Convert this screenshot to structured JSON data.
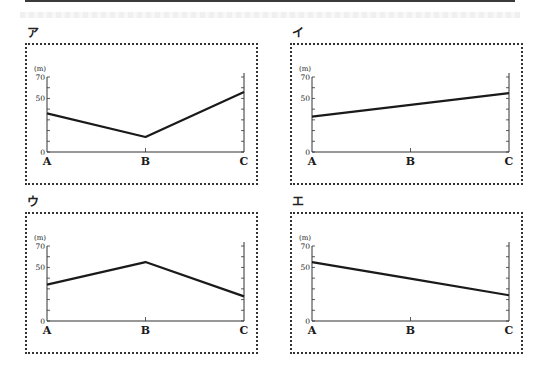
{
  "chart_data": [
    {
      "id": "a",
      "panel_label": "ア",
      "type": "line",
      "title": "",
      "unit_label": "(m)",
      "xlabel": "",
      "ylabel": "(m)",
      "categories": [
        "A",
        "B",
        "C"
      ],
      "values": [
        36,
        14,
        56
      ],
      "ylim": [
        0,
        70
      ],
      "y_ticks": [
        0,
        10,
        20,
        30,
        40,
        50,
        60,
        70
      ],
      "y_tick_labels": [
        "0",
        "50",
        "70"
      ],
      "grid": false,
      "legend": null
    },
    {
      "id": "i",
      "panel_label": "イ",
      "type": "line",
      "title": "",
      "unit_label": "(m)",
      "xlabel": "",
      "ylabel": "(m)",
      "categories": [
        "A",
        "B",
        "C"
      ],
      "values": [
        33,
        44,
        55
      ],
      "ylim": [
        0,
        70
      ],
      "y_ticks": [
        0,
        10,
        20,
        30,
        40,
        50,
        60,
        70
      ],
      "y_tick_labels": [
        "0",
        "50",
        "70"
      ],
      "grid": false,
      "legend": null
    },
    {
      "id": "u",
      "panel_label": "ウ",
      "type": "line",
      "title": "",
      "unit_label": "(m)",
      "xlabel": "",
      "ylabel": "(m)",
      "categories": [
        "A",
        "B",
        "C"
      ],
      "values": [
        34,
        55,
        23
      ],
      "ylim": [
        0,
        70
      ],
      "y_ticks": [
        0,
        10,
        20,
        30,
        40,
        50,
        60,
        70
      ],
      "y_tick_labels": [
        "0",
        "50",
        "70"
      ],
      "grid": false,
      "legend": null
    },
    {
      "id": "e",
      "panel_label": "エ",
      "type": "line",
      "title": "",
      "unit_label": "(m)",
      "xlabel": "",
      "ylabel": "(m)",
      "categories": [
        "A",
        "B",
        "C"
      ],
      "values": [
        55,
        39.5,
        24
      ],
      "ylim": [
        0,
        70
      ],
      "y_ticks": [
        0,
        10,
        20,
        30,
        40,
        50,
        60,
        70
      ],
      "y_tick_labels": [
        "0",
        "50",
        "70"
      ],
      "grid": false,
      "legend": null
    }
  ],
  "colors": {
    "line": "#1a1a1a",
    "axis": "#333333",
    "border": "#333333"
  }
}
